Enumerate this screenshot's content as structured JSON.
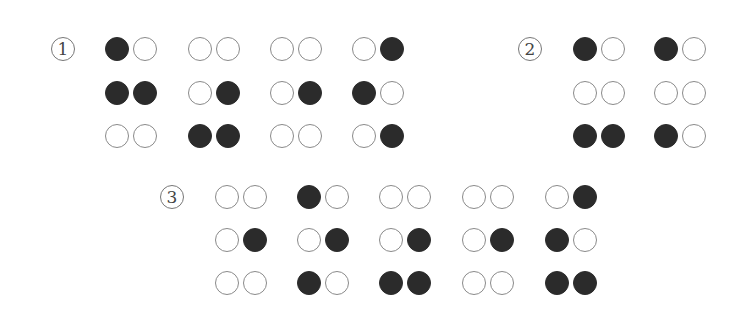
{
  "figure": {
    "colors": {
      "filled": "#2b2b2b",
      "empty_border": "#8a8a8a",
      "background": "#ffffff"
    },
    "groups": [
      {
        "label": "1",
        "label_pos": [
          51,
          37
        ],
        "cells_x": [
          105,
          188,
          270,
          352
        ],
        "rows_y": [
          37,
          81,
          124
        ],
        "cells": [
          [
            [
              1,
              0
            ],
            [
              1,
              1
            ],
            [
              0,
              0
            ]
          ],
          [
            [
              0,
              0
            ],
            [
              0,
              1
            ],
            [
              1,
              1
            ]
          ],
          [
            [
              0,
              0
            ],
            [
              0,
              1
            ],
            [
              0,
              0
            ]
          ],
          [
            [
              0,
              1
            ],
            [
              1,
              0
            ],
            [
              0,
              1
            ]
          ]
        ]
      },
      {
        "label": "2",
        "label_pos": [
          518,
          37
        ],
        "cells_x": [
          573,
          654
        ],
        "rows_y": [
          37,
          81,
          124
        ],
        "cells": [
          [
            [
              1,
              0
            ],
            [
              0,
              0
            ],
            [
              1,
              1
            ]
          ],
          [
            [
              1,
              0
            ],
            [
              0,
              0
            ],
            [
              1,
              0
            ]
          ]
        ]
      },
      {
        "label": "3",
        "label_pos": [
          160,
          185
        ],
        "cells_x": [
          215,
          297,
          379,
          462,
          545
        ],
        "rows_y": [
          185,
          228,
          271
        ],
        "cells": [
          [
            [
              0,
              0
            ],
            [
              0,
              1
            ],
            [
              0,
              0
            ]
          ],
          [
            [
              1,
              0
            ],
            [
              0,
              1
            ],
            [
              1,
              0
            ]
          ],
          [
            [
              0,
              0
            ],
            [
              0,
              1
            ],
            [
              1,
              1
            ]
          ],
          [
            [
              0,
              0
            ],
            [
              0,
              1
            ],
            [
              0,
              0
            ]
          ],
          [
            [
              0,
              1
            ],
            [
              1,
              0
            ],
            [
              1,
              1
            ]
          ]
        ]
      }
    ]
  }
}
